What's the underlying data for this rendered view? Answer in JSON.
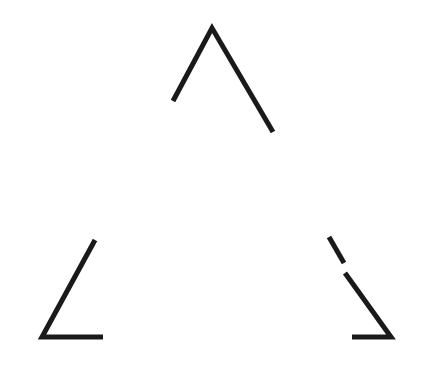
{
  "figure": {
    "canvas": {
      "width": 422,
      "height": 374,
      "background_color": "#ffffff"
    },
    "style": {
      "stroke_color": "#1a1a1a",
      "stroke_width": 5,
      "line_cap": "butt"
    },
    "elements": [
      {
        "name": "top-angle",
        "label": "Top apex angle",
        "kind": "polyline",
        "points": "173,101 212,28 273,132"
      },
      {
        "name": "bottom-left-angle",
        "label": "Bottom-left angle",
        "kind": "polyline",
        "points": "95,240 42,337 103,337"
      },
      {
        "name": "bottom-right-angle-upper-segment",
        "label": "Bottom-right angle, upper diagonal fragment",
        "kind": "line",
        "points": "329,237 344,263"
      },
      {
        "name": "bottom-right-angle-lower-arm",
        "label": "Bottom-right angle, lower diagonal and base",
        "kind": "polyline",
        "points": "345,273 391,337 352,337"
      }
    ]
  }
}
